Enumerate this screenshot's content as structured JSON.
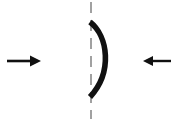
{
  "figure": {
    "title": "Concave surface with opposing horizontal force arrows",
    "background_color": "#ffffff",
    "width": 183,
    "height": 121,
    "elements": {
      "axis": {
        "name": "vertical dashed axis",
        "color": "#8a8a8a",
        "x": 91,
        "y_top": 2,
        "y_bottom": 119,
        "stroke_width": 1.6,
        "dash": "11 7"
      },
      "arc": {
        "name": "curved concave boundary",
        "color": "#111111",
        "stroke_width": 5.6,
        "start_x": 90,
        "start_y": 22,
        "end_x": 90,
        "end_y": 97,
        "bulge_x": 112,
        "path": "M 90 22 C 108 36 113 72 90 97"
      },
      "left_arrow": {
        "name": "left force arrow pointing right",
        "color": "#111111",
        "direction": "right",
        "tail_x": 7,
        "tip_x": 41,
        "y": 61,
        "shaft_width": 2.6,
        "head_length": 11,
        "head_half_height": 5.5
      },
      "right_arrow": {
        "name": "right force arrow pointing left",
        "color": "#111111",
        "direction": "left",
        "tail_x": 171,
        "tip_x": 143,
        "y": 61,
        "shaft_width": 2.4,
        "head_length": 10,
        "head_half_height": 5
      }
    }
  }
}
